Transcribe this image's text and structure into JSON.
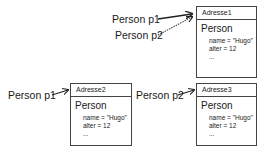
{
  "top": {
    "refs": [
      {
        "label": "Person p1",
        "style": "solid"
      },
      {
        "label": "Person p2",
        "style": "dotted"
      }
    ],
    "object": {
      "address": "Adresse1",
      "class": "Person",
      "fields": [
        "name = \"Hugo\"",
        "alter  = 12",
        "..."
      ]
    }
  },
  "bottom_left": {
    "ref": {
      "label": "Person p1",
      "style": "solid"
    },
    "object": {
      "address": "Adresse2",
      "class": "Person",
      "fields": [
        "name = \"Hugo\"",
        "alter  = 12",
        "..."
      ]
    }
  },
  "bottom_right": {
    "ref": {
      "label": "Person p2",
      "style": "solid"
    },
    "object": {
      "address": "Adresse3",
      "class": "Person",
      "fields": [
        "name = \"Hugo\"",
        "alter  = 12",
        "..."
      ]
    }
  }
}
